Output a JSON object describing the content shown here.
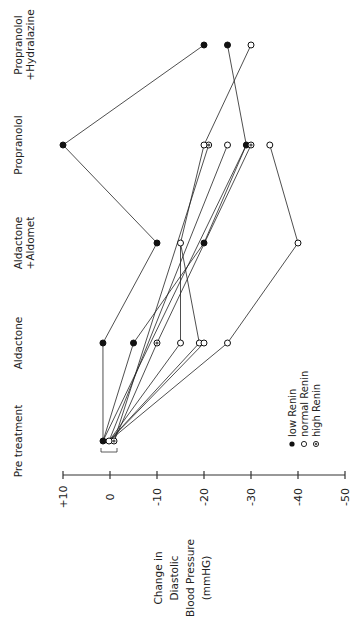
{
  "chart_data": {
    "type": "line",
    "orientation": "rotated-90-ccw",
    "title": "",
    "xlabel": "",
    "ylabel": "Change in Diastolic Blood Pressure (mmHG)",
    "ylabel_lines": [
      "Change in",
      "Diastolic",
      "Blood Pressure",
      "(mmHG)"
    ],
    "ylim": [
      10,
      -50
    ],
    "y_ticks": [
      {
        "value": 10,
        "label": "+10"
      },
      {
        "value": 0,
        "label": "0"
      },
      {
        "value": -10,
        "label": "-10"
      },
      {
        "value": -20,
        "label": "-20"
      },
      {
        "value": -30,
        "label": "-30"
      },
      {
        "value": -40,
        "label": "-40"
      },
      {
        "value": -50,
        "label": "-50"
      }
    ],
    "categories": [
      {
        "label": "Pre treatment",
        "lines": [
          "Pre treatment"
        ]
      },
      {
        "label": "Aldactone",
        "lines": [
          "Aldactone"
        ]
      },
      {
        "label": "Aldactone +Aldomet",
        "lines": [
          "Aldactone",
          "+Aldomet"
        ]
      },
      {
        "label": "Propranolol",
        "lines": [
          "Propranolol"
        ]
      },
      {
        "label": "Propranolol +Hydralazine",
        "lines": [
          "Propranolol",
          "+Hydralazine"
        ]
      }
    ],
    "legend": [
      {
        "marker": "filled",
        "label": "low Renin"
      },
      {
        "marker": "open",
        "label": "normal Renin"
      },
      {
        "marker": "hatched",
        "label": "high Renin"
      }
    ],
    "legend_position": "lower-right (rotated)",
    "grid": false,
    "series": [
      {
        "name": "Patient 1",
        "group": "low Renin",
        "points": [
          [
            0,
            1
          ],
          [
            1,
            1.5
          ],
          [
            2,
            -10
          ],
          [
            3,
            10
          ],
          [
            4,
            -20
          ]
        ]
      },
      {
        "name": "Patient 2",
        "group": "low Renin",
        "points": [
          [
            0,
            1
          ],
          [
            1,
            -5
          ],
          [
            2,
            -20
          ],
          [
            3,
            -29
          ],
          [
            4,
            -25
          ]
        ]
      },
      {
        "name": "Patient 3",
        "group": "high Renin",
        "points": [
          [
            0,
            -1
          ],
          [
            1,
            -10
          ],
          [
            3,
            -30
          ]
        ]
      },
      {
        "name": "Patient 4",
        "group": "high Renin",
        "points": [
          [
            0,
            -1
          ],
          [
            3,
            -21
          ]
        ]
      },
      {
        "name": "Patient 5",
        "group": "normal Renin",
        "points": [
          [
            0,
            0
          ],
          [
            1,
            -15
          ],
          [
            2,
            -15
          ],
          [
            3,
            -20
          ],
          [
            4,
            -30
          ]
        ]
      },
      {
        "name": "Patient 6",
        "group": "normal Renin",
        "points": [
          [
            0,
            0
          ],
          [
            1,
            -19
          ],
          [
            2,
            -15
          ]
        ]
      },
      {
        "name": "Patient 7",
        "group": "normal Renin",
        "points": [
          [
            0,
            0
          ],
          [
            1,
            -20
          ]
        ]
      },
      {
        "name": "Patient 8",
        "group": "normal Renin",
        "points": [
          [
            0,
            0
          ],
          [
            1,
            -25
          ],
          [
            2,
            -40
          ],
          [
            3,
            -34
          ]
        ]
      },
      {
        "name": "Patient 9",
        "group": "normal Renin",
        "points": [
          [
            0,
            0
          ],
          [
            3,
            -25
          ]
        ]
      },
      {
        "name": "Patient 10",
        "group": "low Renin",
        "points": [
          [
            0,
            1
          ],
          [
            3,
            -29
          ]
        ]
      }
    ],
    "annotations": [
      "bracket under Pre treatment points"
    ]
  }
}
